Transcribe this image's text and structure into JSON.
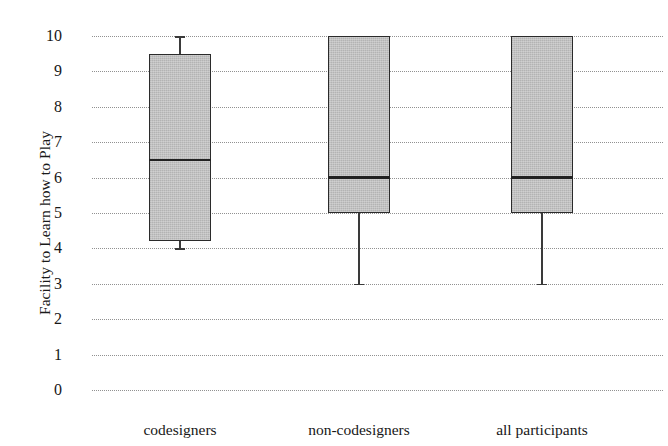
{
  "chart_data": {
    "type": "box",
    "title": "",
    "xlabel": "",
    "ylabel": "Facility to Learn how to Play",
    "ylim": [
      0,
      10
    ],
    "yticks": [
      10,
      9,
      8,
      7,
      6,
      5,
      4,
      3,
      2,
      1,
      0
    ],
    "ytick_labels": [
      "10",
      "9",
      "8",
      "7",
      "6",
      "5",
      "4",
      "3",
      "2",
      "1",
      "0"
    ],
    "grid": "horizontal-dotted",
    "legend": "none",
    "categories": [
      "codesigners",
      "non-codesigners",
      "all participants"
    ],
    "boxes": [
      {
        "category": "codesigners",
        "whisker_low": 4.0,
        "q1": 4.2,
        "median": 6.5,
        "q3": 9.5,
        "whisker_high": 10.0
      },
      {
        "category": "non-codesigners",
        "whisker_low": 3.0,
        "q1": 5.0,
        "median": 6.0,
        "q3": 10.0,
        "whisker_high": 10.0
      },
      {
        "category": "all participants",
        "whisker_low": 3.0,
        "q1": 5.0,
        "median": 6.0,
        "q3": 10.0,
        "whisker_high": 10.0
      }
    ],
    "colors": {
      "box_fill": "#bdbdbd",
      "box_edge": "#2b2b2b",
      "median": "#222222",
      "whisker": "#3a3a3a",
      "grid": "#8c8c8c",
      "text": "#171717",
      "background": "#ffffff"
    }
  },
  "geometry": {
    "y_value_10_px": 36,
    "y_value_0_px": 390,
    "grid_left_px": 92,
    "grid_right_px": 663,
    "box_width_px": 62,
    "box_centers_px": [
      180,
      359,
      542
    ],
    "category_label_y_px": 421,
    "tick_label_x_px": 62
  }
}
